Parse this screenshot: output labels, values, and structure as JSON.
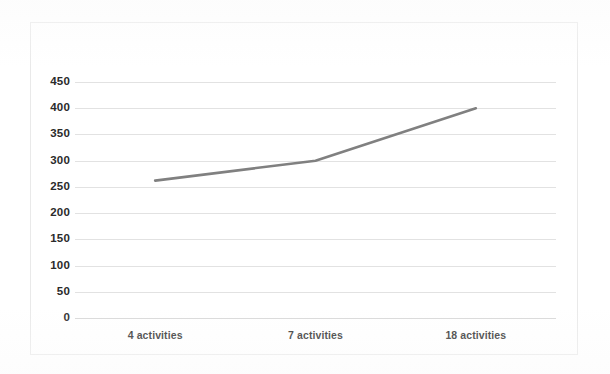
{
  "chart_data": {
    "type": "line",
    "title": "",
    "subtitle": "",
    "xlabel": "",
    "ylabel": "",
    "categories": [
      "4 activities",
      "7 activities",
      "18 activities"
    ],
    "values": [
      262,
      300,
      400
    ],
    "series": [
      {
        "name": "",
        "values": [
          262,
          300,
          400
        ]
      }
    ],
    "ylim": [
      0,
      450
    ],
    "yticks": [
      0,
      50,
      100,
      150,
      200,
      250,
      300,
      350,
      400,
      450
    ],
    "ytick_labels": [
      "0",
      "50",
      "100",
      "150",
      "200",
      "250",
      "300",
      "350",
      "400",
      "450"
    ],
    "grid": "horizontal",
    "legend": "none",
    "markers": "none",
    "line_color": "#808080",
    "gridline_color": "#e2e2e2",
    "plot_background": "#ffffff",
    "frame_color": "#e9e9e9",
    "label_color": "#2b2b2b"
  }
}
